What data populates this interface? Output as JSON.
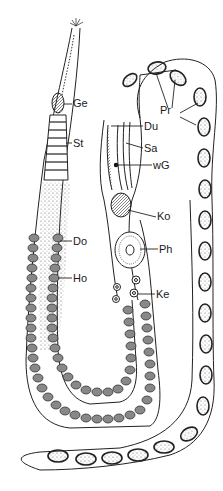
{
  "figure": {
    "type": "anatomical line drawing",
    "line_color": "#222222",
    "background": "#ffffff"
  },
  "labels": {
    "ge": "Ge",
    "st": "St",
    "do": "Do",
    "ho": "Ho",
    "pr": "Pr",
    "du": "Du",
    "sa": "Sa",
    "wg": "wG",
    "ko": "Ko",
    "ph": "Ph",
    "ke": "Ke"
  }
}
